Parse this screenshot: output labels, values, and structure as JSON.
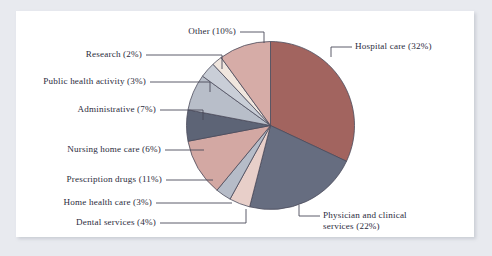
{
  "chart_data": {
    "type": "pie",
    "title": "",
    "subtitle": "",
    "xlabel": "",
    "ylabel": "",
    "grid": false,
    "legend_position": "callout-labels",
    "units": "percent",
    "total": 100,
    "start_angle_deg": 0,
    "direction": "clockwise",
    "categories": [
      "Hospital care",
      "Physician and clinical services",
      "Dental services",
      "Home health care",
      "Prescription drugs",
      "Nursing home care",
      "Administrative",
      "Public health activity",
      "Research",
      "Other"
    ],
    "values": [
      32,
      22,
      4,
      3,
      11,
      6,
      7,
      3,
      2,
      10
    ],
    "colors": [
      "#a2645f",
      "#666d80",
      "#e8cfc9",
      "#b6bcc8",
      "#d3a8a3",
      "#5d6476",
      "#b8bec9",
      "#c9ced7",
      "#f0e6de",
      "#d6aca7"
    ],
    "slices": [
      {
        "label": "Hospital care (32%)",
        "name": "Hospital care",
        "value": 32,
        "color": "#a2645f"
      },
      {
        "label": "Physician and clinical\nservices (22%)",
        "name": "Physician and clinical services",
        "value": 22,
        "color": "#666d80"
      },
      {
        "label": "Dental services (4%)",
        "name": "Dental services",
        "value": 4,
        "color": "#e8cfc9"
      },
      {
        "label": "Home health care (3%)",
        "name": "Home health care",
        "value": 3,
        "color": "#b6bcc8"
      },
      {
        "label": "Prescription drugs (11%)",
        "name": "Prescription drugs",
        "value": 11,
        "color": "#d3a8a3"
      },
      {
        "label": "Nursing home care (6%)",
        "name": "Nursing home care",
        "value": 6,
        "color": "#5d6476"
      },
      {
        "label": "Administrative (7%)",
        "name": "Administrative",
        "value": 7,
        "color": "#b8bec9"
      },
      {
        "label": "Public health activity (3%)",
        "name": "Public health activity",
        "value": 3,
        "color": "#c9ced7"
      },
      {
        "label": "Research (2%)",
        "name": "Research",
        "value": 2,
        "color": "#f0e6de"
      },
      {
        "label": "Other (10%)",
        "name": "Other",
        "value": 10,
        "color": "#d6aca7"
      }
    ]
  },
  "labels": {
    "hospital_care": "Hospital care (32%)",
    "physician_line1": "Physician and clinical",
    "physician_line2": "services (22%)",
    "dental_services": "Dental services (4%)",
    "home_health_care": "Home health care (3%)",
    "prescription_drugs": "Prescription drugs (11%)",
    "nursing_home_care": "Nursing home care (6%)",
    "administrative": "Administrative (7%)",
    "public_health_activity": "Public health activity (3%)",
    "research": "Research (2%)",
    "other": "Other (10%)"
  },
  "style": {
    "page_background": "#e8eaef",
    "panel_background": "#ffffff",
    "text_color": "#2b2b3c",
    "slice_outline": "#4a4a5a",
    "leader_line_color": "#4a4a5a"
  }
}
